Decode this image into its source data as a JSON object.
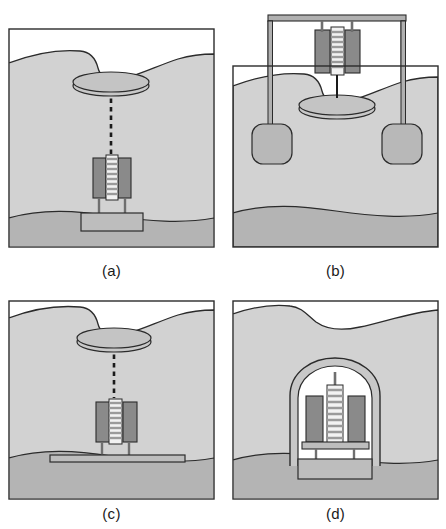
{
  "figure": {
    "panel_count": 4,
    "background_color": "#ffffff"
  },
  "palette": {
    "outline": "#2b2b2b",
    "sediment_upper": "#d2d2d2",
    "sediment_lower": "#b4b4b4",
    "water_white": "#ffffff",
    "float_disc": "#c4c4c4",
    "instrument_dark_block": "#8a8a8a",
    "instrument_stripe_light": "#f2f2f2",
    "instrument_stripe_dark": "#a8a8a8",
    "base_plate": "#bdbdbd",
    "frame_metal": "#b0b0b0",
    "anchor_block": "#b8b8b8",
    "dome_shell": "#c8c8c8",
    "tether_dash": "#1a1a1a"
  },
  "panels": [
    {
      "id": "a",
      "caption": "(a)",
      "description": "Instrument on a compact rectangular base plate buried in sediment, linked by a dashed tether to a surface float disc",
      "elements": {
        "float_disc": "surface-float-disc",
        "tether": "dashed-tether-line",
        "instrument": "striped-sensor-column-with-side-blocks",
        "base": "rectangular-base-plate",
        "strata": [
          "upper-sediment",
          "lower-sediment"
        ]
      }
    },
    {
      "id": "b",
      "caption": "(b)",
      "description": "Instrument suspended above the seabed from an overhead gantry beam with two rounded anchor blocks, tethered down to a float disc resting in the seabed notch",
      "elements": {
        "gantry_beam": "overhead-horizontal-beam",
        "gantry_legs": "two-vertical-legs",
        "anchors": "two-rounded-square-anchor-blocks",
        "instrument": "striped-sensor-column-with-side-blocks",
        "float_disc": "surface-float-disc",
        "tether": "solid-tether-line",
        "strata": [
          "upper-sediment",
          "lower-sediment"
        ]
      }
    },
    {
      "id": "c",
      "caption": "(c)",
      "description": "Instrument mounted on a wide thin horizontal plate with slender legs, linked by a dashed tether to a surface float disc",
      "elements": {
        "float_disc": "surface-float-disc",
        "tether": "dashed-tether-line",
        "instrument": "striped-sensor-column-with-side-blocks",
        "base": "wide-horizontal-plate",
        "strata": [
          "upper-sediment",
          "lower-sediment"
        ]
      }
    },
    {
      "id": "d",
      "caption": "(d)",
      "description": "Instrument fully enclosed inside an arched dome shell seated on a rectangular base plate within the sediment, no surface float",
      "elements": {
        "dome": "arched-protective-dome-shell",
        "instrument": "striped-sensor-column-with-side-blocks",
        "base": "rectangular-base-plate",
        "strata": [
          "upper-sediment",
          "lower-sediment"
        ]
      }
    }
  ]
}
